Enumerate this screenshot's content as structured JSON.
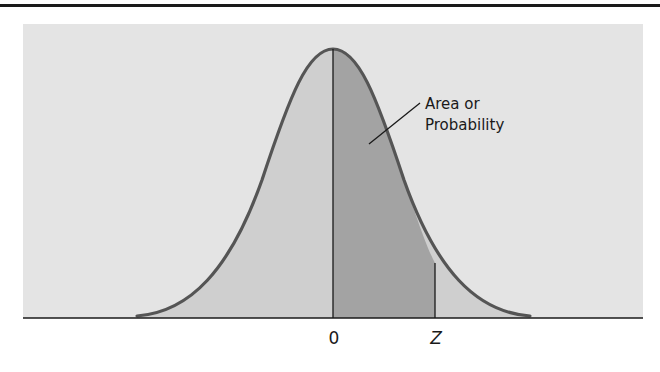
{
  "figure": {
    "type": "standard-normal-curve",
    "annotation": {
      "line1": "Area or",
      "line2": "Probability"
    },
    "axis_labels": {
      "zero": "0",
      "z": "Z"
    },
    "shaded_region": {
      "from": "0",
      "to": "Z"
    },
    "colors": {
      "background_panel": "#e4e4e4",
      "under_curve": "#cfcfcf",
      "shaded_area": "#a3a3a3",
      "curve": "#555555",
      "lines": "#1a1a1a"
    }
  }
}
